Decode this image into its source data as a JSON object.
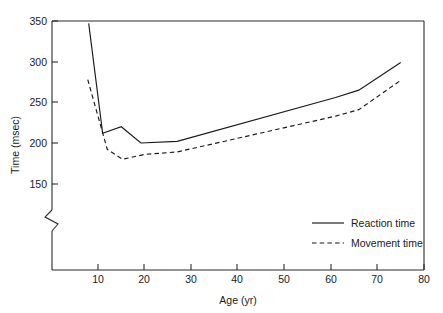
{
  "chart_data": {
    "type": "line",
    "title": "",
    "xlabel": "Age (yr)",
    "ylabel": "Time (msec)",
    "xlim": [
      0,
      80
    ],
    "ylim": [
      140,
      350
    ],
    "grid": false,
    "y_axis_break": true,
    "y_axis_break_note": "axis break below 150",
    "legend_position": "inside lower right",
    "xticks": [
      10,
      20,
      30,
      40,
      50,
      60,
      70,
      80
    ],
    "xtick_labels": [
      "10",
      "20",
      "30",
      "40",
      "50",
      "60",
      "70",
      "80"
    ],
    "yticks": [
      150,
      200,
      250,
      300,
      350
    ],
    "ytick_labels": [
      "150",
      "200",
      "250",
      "300",
      "350"
    ],
    "series": [
      {
        "name": "Reaction time",
        "style": "solid",
        "x": [
          8.0,
          11.0,
          15.0,
          19.2,
          27.0,
          61.0,
          66.0,
          75.0
        ],
        "values": [
          347,
          212,
          220,
          200,
          202,
          256,
          265,
          299
        ]
      },
      {
        "name": "Movement time",
        "style": "dashed",
        "x": [
          7.8,
          12.0,
          15.3,
          20.0,
          27.0,
          61.0,
          66.0,
          75.0
        ],
        "values": [
          278,
          192,
          180,
          186,
          189,
          233,
          241,
          277
        ]
      }
    ]
  },
  "legend": {
    "items": [
      {
        "label": "Reaction time",
        "style": "solid"
      },
      {
        "label": "Movement time",
        "style": "dashed"
      }
    ]
  },
  "axes": {
    "x_title": "Age (yr)",
    "y_title": "Time (msec)"
  }
}
